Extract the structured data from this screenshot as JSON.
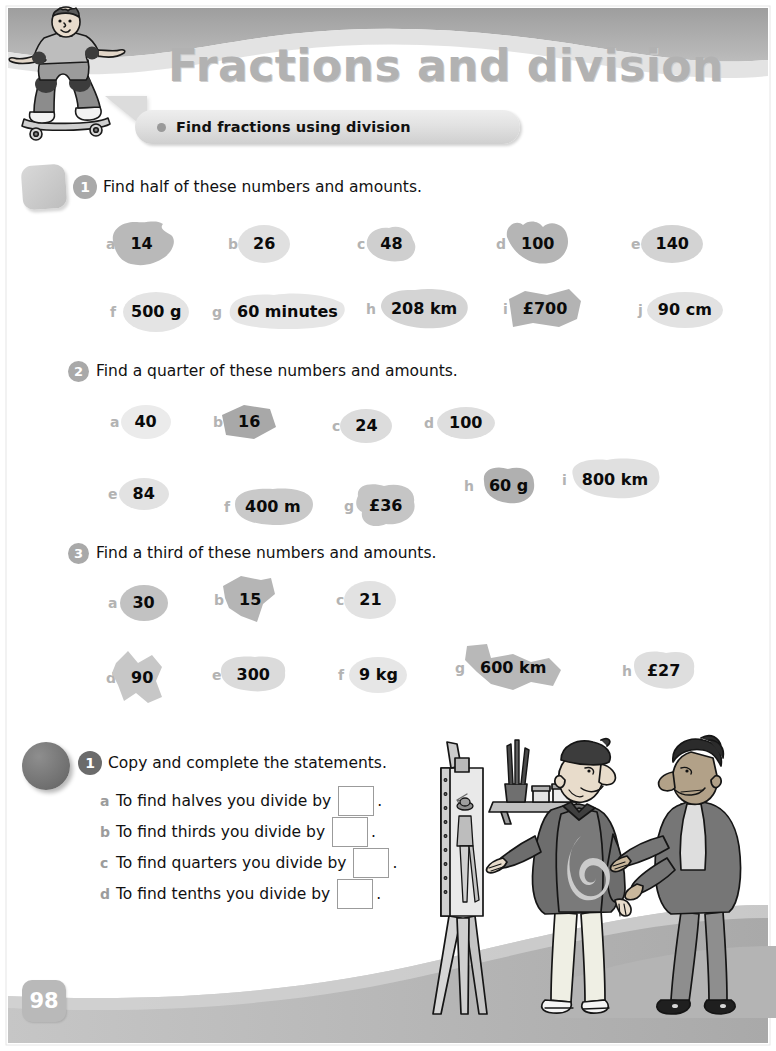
{
  "header": {
    "title": "Fractions and division",
    "objective": "Find fractions using division",
    "objective_dot_icon": "bullet-dot-icon"
  },
  "page_number": "98",
  "exercises": [
    {
      "number": "1",
      "marker": "square-marker",
      "instruction": "Find half of these numbers and amounts.",
      "items": [
        {
          "letter": "a",
          "value": "14"
        },
        {
          "letter": "b",
          "value": "26"
        },
        {
          "letter": "c",
          "value": "48"
        },
        {
          "letter": "d",
          "value": "100"
        },
        {
          "letter": "e",
          "value": "140"
        },
        {
          "letter": "f",
          "value": "500 g"
        },
        {
          "letter": "g",
          "value": "60 minutes"
        },
        {
          "letter": "h",
          "value": "208 km"
        },
        {
          "letter": "i",
          "value": "£700"
        },
        {
          "letter": "j",
          "value": "90 cm"
        }
      ]
    },
    {
      "number": "2",
      "marker": "circle-badge",
      "instruction": "Find a quarter of these numbers and amounts.",
      "items": [
        {
          "letter": "a",
          "value": "40"
        },
        {
          "letter": "b",
          "value": "16"
        },
        {
          "letter": "c",
          "value": "24"
        },
        {
          "letter": "d",
          "value": "100"
        },
        {
          "letter": "e",
          "value": "84"
        },
        {
          "letter": "f",
          "value": "400 m"
        },
        {
          "letter": "g",
          "value": "£36"
        },
        {
          "letter": "h",
          "value": "60 g"
        },
        {
          "letter": "i",
          "value": "800 km"
        }
      ]
    },
    {
      "number": "3",
      "marker": "circle-badge",
      "instruction": "Find a third of these numbers and amounts.",
      "items": [
        {
          "letter": "a",
          "value": "30"
        },
        {
          "letter": "b",
          "value": "15"
        },
        {
          "letter": "c",
          "value": "21"
        },
        {
          "letter": "d",
          "value": "90"
        },
        {
          "letter": "e",
          "value": "300"
        },
        {
          "letter": "f",
          "value": "9 kg"
        },
        {
          "letter": "g",
          "value": "600 km"
        },
        {
          "letter": "h",
          "value": "£27"
        }
      ]
    }
  ],
  "section_b": {
    "number": "1",
    "marker": "dark-circle-marker",
    "instruction": "Copy and complete the statements.",
    "statements": [
      {
        "letter": "a",
        "text": "To find halves you divide by",
        "answer": "",
        "period": "."
      },
      {
        "letter": "b",
        "text": "To find thirds you divide by",
        "answer": "",
        "period": "."
      },
      {
        "letter": "c",
        "text": "To find quarters you divide by",
        "answer": "",
        "period": "."
      },
      {
        "letter": "d",
        "text": "To find tenths you divide by",
        "answer": "",
        "period": "."
      }
    ]
  },
  "illustrations": {
    "skateboarder": "skateboarder-icon",
    "artists": "two-artists-with-easel-icon"
  },
  "colors": {
    "title_gray": "#b2b2b2",
    "wave_gray": "#a8a8a8",
    "blob_gray": "#c9c9c9",
    "badge_gray": "#a9a9a9",
    "page_num_gray": "#b9b9b9"
  }
}
